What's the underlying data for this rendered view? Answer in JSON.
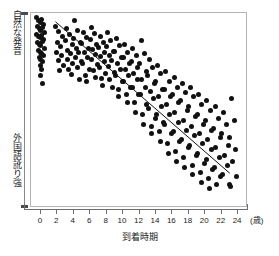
{
  "chart_data": {
    "type": "scatter",
    "title": "",
    "xlabel": "到着時期",
    "xunit": "(歳)",
    "ylabel_top": "自然な発音",
    "ylabel_bottom": "外国語訛り強",
    "xlim": [
      -1.2,
      25.2
    ],
    "ylim": [
      0,
      100
    ],
    "grid": false,
    "legend": "none",
    "xticks": [
      0,
      2,
      4,
      6,
      8,
      10,
      12,
      14,
      16,
      18,
      20,
      22,
      24
    ],
    "xticklabels": [
      "0",
      "2",
      "4",
      "6",
      "8",
      "10",
      "12",
      "14",
      "16",
      "18",
      "20",
      "22",
      "24"
    ],
    "yticks": [],
    "yticklabels": [],
    "series": [
      {
        "name": "参加者",
        "marker": "filled-circle",
        "color": "#111111",
        "points": [
          [
            -0.5,
            97.5
          ],
          [
            -0.3,
            96.0
          ],
          [
            -0.1,
            95.0
          ],
          [
            0.1,
            96.5
          ],
          [
            0.3,
            94.0
          ],
          [
            -0.4,
            93.0
          ],
          [
            -0.2,
            92.0
          ],
          [
            0.0,
            91.0
          ],
          [
            0.2,
            92.5
          ],
          [
            0.4,
            90.0
          ],
          [
            -0.5,
            89.0
          ],
          [
            -0.3,
            88.0
          ],
          [
            -0.1,
            87.5
          ],
          [
            0.1,
            88.5
          ],
          [
            0.3,
            86.5
          ],
          [
            -0.4,
            85.0
          ],
          [
            -0.2,
            84.0
          ],
          [
            0.0,
            83.5
          ],
          [
            0.2,
            85.5
          ],
          [
            0.4,
            82.0
          ],
          [
            -0.3,
            81.0
          ],
          [
            -0.1,
            80.0
          ],
          [
            0.1,
            79.0
          ],
          [
            0.3,
            78.0
          ],
          [
            -0.2,
            77.0
          ],
          [
            0.0,
            76.0
          ],
          [
            0.2,
            75.0
          ],
          [
            -0.1,
            73.0
          ],
          [
            0.1,
            71.0
          ],
          [
            0.0,
            68.0
          ],
          [
            0.2,
            64.0
          ],
          [
            1.8,
            93.0
          ],
          [
            2.2,
            90.5
          ],
          [
            2.6,
            88.0
          ],
          [
            2.0,
            85.0
          ],
          [
            2.4,
            83.0
          ],
          [
            1.9,
            80.0
          ],
          [
            2.5,
            78.0
          ],
          [
            2.1,
            75.5
          ],
          [
            2.8,
            73.0
          ],
          [
            2.3,
            70.5
          ],
          [
            3.1,
            92.0
          ],
          [
            3.5,
            89.0
          ],
          [
            3.0,
            86.0
          ],
          [
            3.8,
            84.0
          ],
          [
            3.3,
            81.0
          ],
          [
            3.6,
            79.0
          ],
          [
            3.2,
            76.0
          ],
          [
            3.9,
            74.0
          ],
          [
            3.4,
            71.0
          ],
          [
            3.7,
            68.5
          ],
          [
            4.1,
            96.0
          ],
          [
            4.5,
            91.0
          ],
          [
            4.0,
            87.0
          ],
          [
            4.8,
            85.0
          ],
          [
            4.3,
            82.0
          ],
          [
            4.6,
            80.0
          ],
          [
            4.2,
            77.0
          ],
          [
            4.9,
            75.0
          ],
          [
            4.4,
            72.0
          ],
          [
            4.7,
            66.0
          ],
          [
            5.2,
            90.0
          ],
          [
            5.6,
            87.5
          ],
          [
            5.0,
            84.5
          ],
          [
            5.8,
            82.0
          ],
          [
            5.3,
            79.5
          ],
          [
            5.7,
            77.0
          ],
          [
            5.1,
            74.0
          ],
          [
            5.9,
            71.0
          ],
          [
            5.4,
            68.0
          ],
          [
            5.5,
            65.0
          ],
          [
            6.1,
            92.5
          ],
          [
            6.5,
            89.5
          ],
          [
            6.0,
            86.5
          ],
          [
            6.8,
            84.0
          ],
          [
            6.3,
            81.5
          ],
          [
            6.6,
            78.5
          ],
          [
            6.2,
            76.0
          ],
          [
            6.9,
            73.5
          ],
          [
            6.4,
            70.5
          ],
          [
            6.7,
            67.0
          ],
          [
            7.2,
            88.0
          ],
          [
            7.6,
            85.0
          ],
          [
            7.0,
            82.5
          ],
          [
            7.8,
            80.0
          ],
          [
            7.3,
            77.5
          ],
          [
            7.7,
            75.0
          ],
          [
            7.1,
            72.0
          ],
          [
            7.9,
            69.0
          ],
          [
            7.4,
            66.5
          ],
          [
            7.5,
            63.0
          ],
          [
            8.1,
            90.0
          ],
          [
            8.5,
            86.0
          ],
          [
            8.0,
            83.0
          ],
          [
            8.8,
            80.5
          ],
          [
            8.3,
            78.0
          ],
          [
            8.6,
            75.5
          ],
          [
            8.2,
            72.5
          ],
          [
            8.9,
            69.5
          ],
          [
            8.4,
            66.0
          ],
          [
            8.7,
            62.0
          ],
          [
            9.2,
            87.0
          ],
          [
            9.6,
            83.5
          ],
          [
            9.0,
            80.5
          ],
          [
            9.8,
            77.0
          ],
          [
            9.3,
            74.0
          ],
          [
            9.7,
            71.0
          ],
          [
            9.1,
            68.0
          ],
          [
            9.9,
            65.0
          ],
          [
            9.4,
            61.0
          ],
          [
            9.5,
            57.0
          ],
          [
            10.2,
            84.0
          ],
          [
            10.6,
            80.0
          ],
          [
            10.0,
            77.0
          ],
          [
            10.8,
            74.0
          ],
          [
            10.3,
            71.0
          ],
          [
            10.7,
            68.0
          ],
          [
            10.1,
            65.0
          ],
          [
            10.9,
            62.0
          ],
          [
            10.4,
            58.0
          ],
          [
            10.5,
            54.0
          ],
          [
            11.2,
            82.0
          ],
          [
            11.6,
            78.0
          ],
          [
            11.0,
            75.0
          ],
          [
            11.8,
            72.0
          ],
          [
            11.3,
            69.0
          ],
          [
            11.7,
            66.0
          ],
          [
            11.1,
            62.0
          ],
          [
            11.9,
            58.0
          ],
          [
            11.4,
            54.0
          ],
          [
            11.5,
            49.0
          ],
          [
            12.2,
            86.0
          ],
          [
            12.6,
            79.0
          ],
          [
            12.0,
            74.0
          ],
          [
            12.8,
            70.0
          ],
          [
            12.3,
            66.0
          ],
          [
            12.7,
            62.0
          ],
          [
            12.1,
            58.0
          ],
          [
            12.9,
            53.0
          ],
          [
            12.4,
            48.0
          ],
          [
            12.5,
            43.0
          ],
          [
            13.2,
            76.0
          ],
          [
            13.6,
            72.0
          ],
          [
            13.0,
            68.0
          ],
          [
            13.8,
            64.0
          ],
          [
            13.3,
            60.0
          ],
          [
            13.7,
            56.0
          ],
          [
            13.1,
            51.0
          ],
          [
            13.9,
            46.0
          ],
          [
            13.4,
            42.0
          ],
          [
            13.5,
            38.0
          ],
          [
            14.2,
            73.0
          ],
          [
            14.6,
            69.0
          ],
          [
            14.0,
            65.0
          ],
          [
            14.8,
            61.0
          ],
          [
            14.3,
            57.0
          ],
          [
            14.7,
            52.0
          ],
          [
            14.1,
            48.0
          ],
          [
            14.9,
            44.0
          ],
          [
            14.4,
            39.0
          ],
          [
            14.5,
            34.0
          ],
          [
            15.2,
            70.0
          ],
          [
            15.6,
            65.0
          ],
          [
            15.0,
            61.0
          ],
          [
            15.8,
            57.0
          ],
          [
            15.3,
            53.0
          ],
          [
            15.7,
            48.0
          ],
          [
            15.1,
            43.0
          ],
          [
            15.9,
            38.0
          ],
          [
            15.4,
            33.0
          ],
          [
            15.5,
            28.0
          ],
          [
            16.2,
            67.0
          ],
          [
            16.6,
            62.0
          ],
          [
            16.0,
            58.0
          ],
          [
            16.8,
            54.0
          ],
          [
            16.3,
            49.0
          ],
          [
            16.7,
            44.0
          ],
          [
            16.1,
            39.0
          ],
          [
            16.9,
            34.0
          ],
          [
            16.4,
            29.0
          ],
          [
            16.5,
            24.0
          ],
          [
            17.2,
            64.0
          ],
          [
            17.6,
            59.0
          ],
          [
            17.0,
            55.0
          ],
          [
            17.8,
            50.0
          ],
          [
            17.3,
            45.0
          ],
          [
            17.7,
            40.0
          ],
          [
            17.1,
            35.0
          ],
          [
            17.9,
            31.0
          ],
          [
            17.4,
            26.0
          ],
          [
            17.5,
            21.0
          ],
          [
            18.2,
            62.0
          ],
          [
            18.6,
            57.0
          ],
          [
            18.0,
            52.0
          ],
          [
            18.8,
            47.0
          ],
          [
            18.3,
            42.0
          ],
          [
            18.7,
            37.0
          ],
          [
            18.1,
            32.0
          ],
          [
            18.9,
            27.0
          ],
          [
            18.4,
            22.0
          ],
          [
            18.5,
            17.0
          ],
          [
            19.2,
            58.0
          ],
          [
            19.6,
            53.0
          ],
          [
            19.0,
            48.0
          ],
          [
            19.8,
            43.0
          ],
          [
            19.3,
            38.0
          ],
          [
            19.7,
            33.0
          ],
          [
            19.1,
            28.0
          ],
          [
            19.9,
            23.0
          ],
          [
            19.4,
            18.0
          ],
          [
            19.5,
            13.0
          ],
          [
            20.2,
            55.0
          ],
          [
            20.6,
            50.0
          ],
          [
            20.0,
            45.0
          ],
          [
            20.8,
            40.0
          ],
          [
            20.3,
            35.0
          ],
          [
            20.7,
            30.0
          ],
          [
            20.1,
            25.0
          ],
          [
            20.9,
            20.0
          ],
          [
            20.4,
            15.0
          ],
          [
            20.5,
            10.0
          ],
          [
            21.2,
            52.0
          ],
          [
            21.6,
            46.0
          ],
          [
            21.0,
            41.0
          ],
          [
            21.8,
            36.0
          ],
          [
            21.3,
            31.0
          ],
          [
            21.7,
            26.0
          ],
          [
            21.1,
            21.0
          ],
          [
            21.9,
            16.0
          ],
          [
            21.4,
            12.0
          ],
          [
            22.2,
            49.0
          ],
          [
            22.6,
            43.0
          ],
          [
            22.0,
            38.0
          ],
          [
            22.8,
            32.0
          ],
          [
            22.3,
            27.0
          ],
          [
            22.7,
            22.0
          ],
          [
            22.1,
            17.0
          ],
          [
            22.9,
            12.0
          ],
          [
            23.2,
            56.0
          ],
          [
            23.5,
            45.0
          ],
          [
            23.0,
            36.0
          ],
          [
            23.7,
            30.0
          ],
          [
            23.3,
            24.0
          ],
          [
            23.8,
            16.0
          ],
          [
            23.1,
            11.0
          ]
        ]
      }
    ],
    "fit_line": {
      "name": "回帰直線",
      "color": "#111111",
      "x_start": 1.8,
      "y_start": 95.5,
      "x_end": 23.2,
      "y_end": 17.0
    }
  }
}
